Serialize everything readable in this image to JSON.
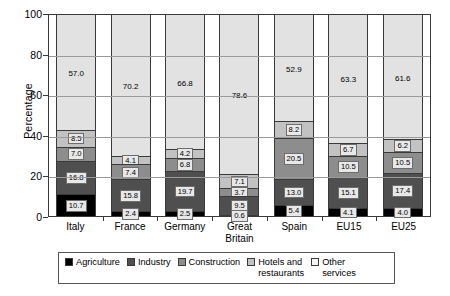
{
  "chart_data": {
    "type": "bar",
    "subtype": "stacked-bar-100",
    "title": "",
    "xlabel": "",
    "ylabel": "Percentage",
    "ylim": [
      0,
      100
    ],
    "yticks": [
      0,
      20,
      40,
      60,
      80,
      100
    ],
    "grid": true,
    "legend_position": "bottom",
    "categories": [
      "Italy",
      "France",
      "Germany",
      "Great Britain",
      "Spain",
      "EU15",
      "EU25"
    ],
    "category_lines": [
      [
        "Italy"
      ],
      [
        "France"
      ],
      [
        "Germany"
      ],
      [
        "Great",
        "Britain"
      ],
      [
        "Spain"
      ],
      [
        "EU15"
      ],
      [
        "EU25"
      ]
    ],
    "series": [
      {
        "name": "Agriculture",
        "color": "#000000",
        "values": [
          10.7,
          2.4,
          2.5,
          0.6,
          5.4,
          4.1,
          4.0
        ]
      },
      {
        "name": "Industry",
        "color": "#4f4f4f",
        "values": [
          16.8,
          15.8,
          19.7,
          9.5,
          13.0,
          15.1,
          17.4
        ]
      },
      {
        "name": "Construction",
        "color": "#8d8d8d",
        "values": [
          7.0,
          7.4,
          6.8,
          3.7,
          20.5,
          10.5,
          10.5
        ]
      },
      {
        "name": "Hotels and restaurants",
        "color": "#c2c2c2",
        "values": [
          8.5,
          4.1,
          4.2,
          7.1,
          8.2,
          6.7,
          6.2
        ]
      },
      {
        "name": "Other services",
        "color": "#e2e2e2",
        "values": [
          57.0,
          70.2,
          66.8,
          78.6,
          52.9,
          63.3,
          61.6
        ]
      }
    ]
  },
  "axis": {
    "ylabel": "Percentage",
    "ytick_labels": [
      "100",
      "80",
      "60",
      "40",
      "20",
      "0"
    ]
  },
  "legend": {
    "items": [
      {
        "label": "Agriculture",
        "color": "#000000"
      },
      {
        "label": "Industry",
        "color": "#4f4f4f"
      },
      {
        "label": "Construction",
        "color": "#8d8d8d"
      },
      {
        "label": "Hotels and\nrestaurants",
        "color": "#c2c2c2"
      },
      {
        "label": "Other\nservices",
        "color": "#f4f4f4"
      }
    ]
  }
}
